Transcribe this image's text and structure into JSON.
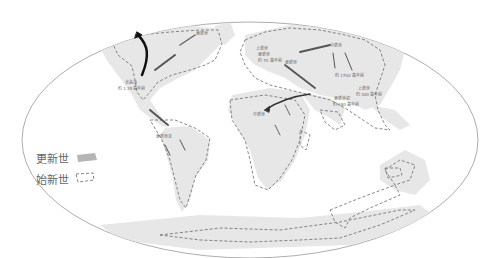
{
  "legend": {
    "items": [
      {
        "label": "更新世",
        "symbol": "filled-gray"
      },
      {
        "label": "始新世",
        "symbol": "dashed-outline"
      }
    ]
  },
  "map": {
    "projection": "mollweide-ellipse",
    "labels": [
      {
        "id": "beringia",
        "text": "更新世"
      },
      {
        "id": "north-america",
        "text": "北美洲"
      },
      {
        "id": "north-america-date",
        "text": "約 1.35 萬年前"
      },
      {
        "id": "south-america",
        "text": "更新世末"
      },
      {
        "id": "europe-1",
        "text": "上新世"
      },
      {
        "id": "europe-2",
        "text": "更新世"
      },
      {
        "id": "europe-3",
        "text": "約 70 萬年前"
      },
      {
        "id": "europe-4",
        "text": "更新世"
      },
      {
        "id": "asia-1",
        "text": "中新世"
      },
      {
        "id": "asia-2",
        "text": "約 1700 萬年前"
      },
      {
        "id": "asia-3",
        "text": "上新世"
      },
      {
        "id": "asia-4",
        "text": "約 300 萬年前"
      },
      {
        "id": "india-1",
        "text": "更新世初"
      },
      {
        "id": "india-2",
        "text": "約 180 萬年前"
      },
      {
        "id": "africa",
        "text": "中新世"
      }
    ]
  },
  "colors": {
    "land_pleistocene": "#e6e6e6",
    "eocene_outline": "#6a6a6a",
    "ellipse": "#888888",
    "arrow": "#333333"
  }
}
